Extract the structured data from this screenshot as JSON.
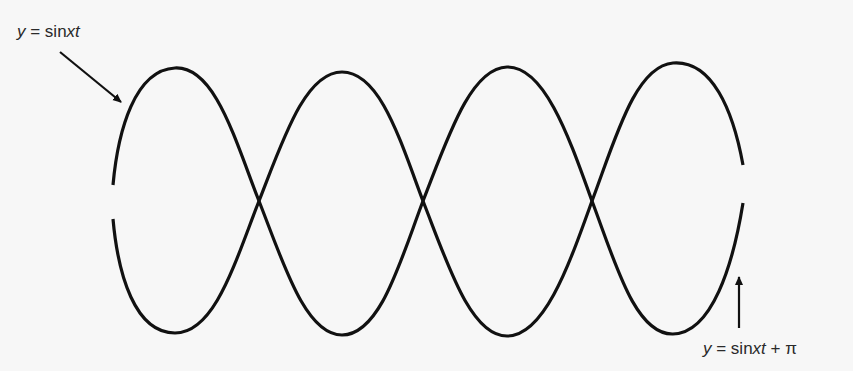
{
  "figure": {
    "background": "#f7f7f7",
    "stroke_color": "#111111",
    "curves": [
      {
        "id": "curve-1",
        "equation": "y = sin xt",
        "phase": 0
      },
      {
        "id": "curve-2",
        "equation": "y = sin xt + π",
        "phase": 3.14159
      }
    ]
  },
  "labels": {
    "top": {
      "var": "y",
      "eq": " = sin",
      "x": "x",
      "t": "t",
      "suffix": ""
    },
    "bottom": {
      "var": "y",
      "eq": " = sin",
      "x": "x",
      "t": "t",
      "suffix": " + π"
    }
  }
}
